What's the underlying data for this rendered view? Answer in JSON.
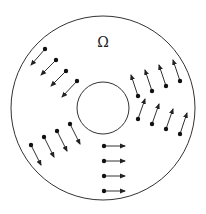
{
  "diagram": {
    "label": "Ω",
    "label_pos": [
      103,
      42
    ],
    "outer_circle": {
      "cx": 103,
      "cy": 108,
      "r": 92
    },
    "inner_circle": {
      "cx": 103,
      "cy": 108,
      "r": 26
    },
    "stroke_color": "#333333",
    "arrow_groups": [
      {
        "name": "upper-left",
        "arrows": [
          {
            "from": [
              45,
              49
            ],
            "to": [
              31,
              65
            ]
          },
          {
            "from": [
              56,
              60
            ],
            "to": [
              41,
              75
            ]
          },
          {
            "from": [
              66,
              71
            ],
            "to": [
              51,
              86
            ]
          },
          {
            "from": [
              77,
              81
            ],
            "to": [
              62,
              97
            ]
          }
        ]
      },
      {
        "name": "right-upper",
        "arrows": [
          {
            "from": [
              138,
              96
            ],
            "to": [
              131,
              75
            ]
          },
          {
            "from": [
              152,
              91
            ],
            "to": [
              145,
              70
            ]
          },
          {
            "from": [
              166,
              86
            ],
            "to": [
              159,
              65
            ]
          },
          {
            "from": [
              180,
              81
            ],
            "to": [
              173,
              60
            ]
          }
        ]
      },
      {
        "name": "right-lower",
        "arrows": [
          {
            "from": [
              138,
              119
            ],
            "to": [
              145,
              99
            ]
          },
          {
            "from": [
              152,
              124
            ],
            "to": [
              159,
              104
            ]
          },
          {
            "from": [
              166,
              129
            ],
            "to": [
              173,
              109
            ]
          },
          {
            "from": [
              180,
              134
            ],
            "to": [
              187,
              113
            ]
          }
        ]
      },
      {
        "name": "lower-left",
        "arrows": [
          {
            "from": [
              31,
              145
            ],
            "to": [
              41,
              165
            ]
          },
          {
            "from": [
              44,
              137
            ],
            "to": [
              54,
              157
            ]
          },
          {
            "from": [
              57,
              131
            ],
            "to": [
              67,
              151
            ]
          },
          {
            "from": [
              70,
              124
            ],
            "to": [
              80,
              144
            ]
          }
        ]
      },
      {
        "name": "bottom",
        "arrows": [
          {
            "from": [
              104,
              146
            ],
            "to": [
              125,
              146
            ]
          },
          {
            "from": [
              104,
              161
            ],
            "to": [
              125,
              161
            ]
          },
          {
            "from": [
              104,
              176
            ],
            "to": [
              125,
              176
            ]
          },
          {
            "from": [
              104,
              191
            ],
            "to": [
              125,
              191
            ]
          }
        ]
      }
    ]
  }
}
